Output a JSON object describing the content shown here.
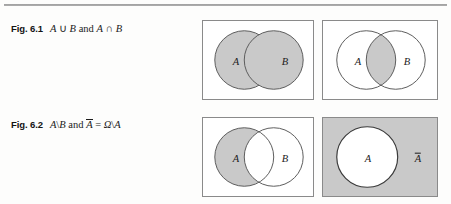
{
  "page": {
    "rule": "horizontal-rule"
  },
  "figures": [
    {
      "number": "Fig. 6.1",
      "caption_parts": {
        "a1": "A",
        "op1": "∪",
        "b1": "B",
        "and": "and",
        "a2": "A",
        "op2": "∩",
        "b2": "B"
      },
      "caption_text": "Fig. 6.1  A ∪ B and A ∩ B",
      "panels": [
        {
          "name": "union",
          "shaded_region": "both-circles",
          "box_fill": "#ffffff",
          "labels": {
            "left": "A",
            "right": "B"
          }
        },
        {
          "name": "intersection",
          "shaded_region": "lens-overlap",
          "box_fill": "#ffffff",
          "labels": {
            "left": "A",
            "right": "B"
          }
        }
      ]
    },
    {
      "number": "Fig. 6.2",
      "caption_parts": {
        "a1": "A",
        "op1": "\\",
        "b1": "B",
        "and": "and",
        "abar": "A",
        "eq": "=",
        "omega": "Ω",
        "op2": "\\",
        "a2": "A"
      },
      "caption_text": "Fig. 6.2  A\\B and Ā = Ω\\A",
      "panels": [
        {
          "name": "difference",
          "shaded_region": "a-minus-b",
          "box_fill": "#ffffff",
          "labels": {
            "left": "A",
            "right": "B"
          }
        },
        {
          "name": "complement",
          "shaded_region": "box-minus-a",
          "box_fill": "#c9c9c9",
          "labels": {
            "left": "A",
            "right": "A-bar"
          }
        }
      ]
    }
  ],
  "colors": {
    "shade": "#c9c9c9",
    "stroke": "#5a5a5a",
    "box_stroke": "#8a8a8a",
    "text": "#1b1b1b",
    "page_bg": "#fdfdfc"
  }
}
